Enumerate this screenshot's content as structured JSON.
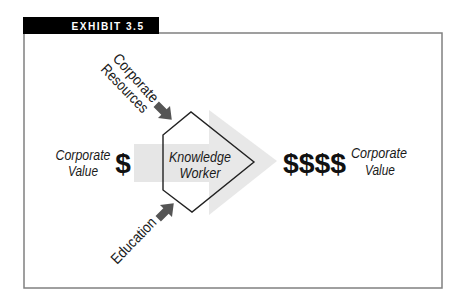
{
  "exhibit": {
    "label": "EXHIBIT 3.5"
  },
  "inputs": {
    "corporate_resources": {
      "lines": [
        "Corporate",
        "Resources"
      ]
    },
    "education": {
      "label": "Education"
    }
  },
  "left": {
    "label_lines": [
      "Corporate",
      "Value"
    ],
    "symbol": "$"
  },
  "center": {
    "lines": [
      "Knowledge",
      "Worker"
    ]
  },
  "right": {
    "symbol": "$$$$",
    "label_lines": [
      "Corporate",
      "Value"
    ]
  },
  "colors": {
    "frame": "#808080",
    "label_background": "#000000",
    "flow_arrow": "#e6e6e6",
    "input_arrows": "#555555",
    "node_outline": "#222222",
    "text": "#1a1a1a"
  }
}
